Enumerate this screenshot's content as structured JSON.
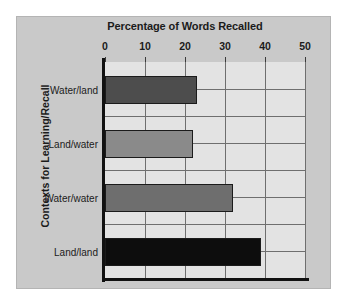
{
  "chart_data": {
    "type": "bar",
    "orientation": "horizontal",
    "title": "Percentage of Words Recalled",
    "xlabel": "Percentage of Words Recalled",
    "ylabel": "Contexts for Learning/Recall",
    "categories": [
      "Water/land",
      "Land/water",
      "Water/water",
      "Land/land"
    ],
    "values": [
      23,
      22,
      32,
      39
    ],
    "xlim": [
      0,
      50
    ],
    "xticks": [
      0,
      10,
      20,
      30,
      40,
      50
    ],
    "xtick_labels": [
      "0",
      "10",
      "20",
      "30",
      "40",
      "50"
    ],
    "grid": "vertical-and-horizontal",
    "legend": "none",
    "bar_colors": [
      "#4d4d4d",
      "#8a8a8a",
      "#6e6e6e",
      "#0d0d0d"
    ],
    "bar_edge_color": "#1b1b1b",
    "plot_background": "#e3e3e3",
    "figure_background": "#c9c9c9",
    "axis_color": "#111111",
    "gridline_color": "#6f6f6f"
  }
}
